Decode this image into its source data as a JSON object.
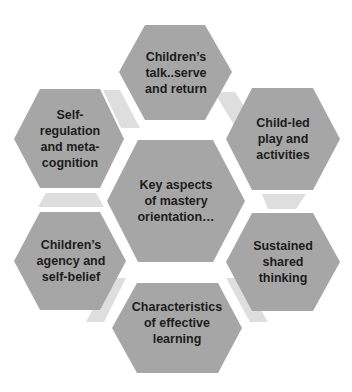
{
  "diagram": {
    "background": "#ffffff",
    "hex_fill": "#a6a6a6",
    "connector_fill": "#dedede",
    "text_color": "#1c1c1c",
    "center": {
      "label": "Key aspects\nof mastery\norientation…"
    },
    "nodes": [
      {
        "id": "top",
        "label": "Children’s\ntalk..serve\nand return"
      },
      {
        "id": "upper-right",
        "label": "Child-led\nplay and\nactivities"
      },
      {
        "id": "lower-right",
        "label": "Sustained\nshared\nthinking"
      },
      {
        "id": "bottom",
        "label": "Characteristics\nof effective\nlearning"
      },
      {
        "id": "lower-left",
        "label": "Children’s\nagency and\nself-belief"
      },
      {
        "id": "upper-left",
        "label": "Self-\nregulation\nand meta-\ncognition"
      }
    ]
  }
}
